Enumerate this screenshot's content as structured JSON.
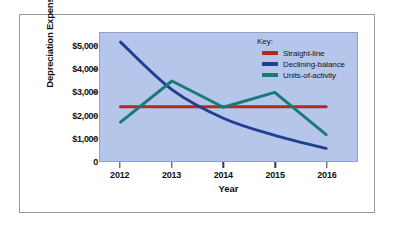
{
  "figure": {
    "background_color": "#ffffff",
    "frame_border_color": "#9a9a9a",
    "plot_background_color": "#b6c6ea"
  },
  "axes": {
    "y_axis_title": "Depreciation Expense",
    "x_axis_title": "Year",
    "y_tick_labels": [
      "$5,000",
      "$4,000",
      "$3,000",
      "$2,000",
      "$1,000",
      "0"
    ],
    "x_tick_labels": [
      "2012",
      "2013",
      "2014",
      "2015",
      "2016"
    ]
  },
  "legend": {
    "title": "Key:",
    "entries": [
      {
        "label": "Straight-line",
        "color": "#b02a2a"
      },
      {
        "label": "Declining-balance",
        "color": "#1f3f8f"
      },
      {
        "label": "Units-of-activity",
        "color": "#1a7a78"
      }
    ]
  },
  "chart_data": {
    "type": "line",
    "title": "",
    "subtitle": "",
    "xlabel": "Year",
    "ylabel": "Depreciation Expense",
    "categories": [
      "2012",
      "2013",
      "2014",
      "2015",
      "2016"
    ],
    "x": [
      2012,
      2013,
      2014,
      2015,
      2016
    ],
    "xlim": [
      2011.6,
      2016.6
    ],
    "ylim": [
      0,
      5600
    ],
    "ytick_values": [
      5000,
      4000,
      3000,
      2000,
      1000,
      0
    ],
    "grid": false,
    "legend_position": "top-right-inside",
    "series": [
      {
        "name": "Straight-line",
        "color": "#b02a2a",
        "smooth": false,
        "values": [
          2375,
          2375,
          2375,
          2375,
          2375
        ]
      },
      {
        "name": "Declining-balance",
        "color": "#1f3f8f",
        "smooth": true,
        "values": [
          5200,
          3120,
          1870,
          1120,
          550
        ]
      },
      {
        "name": "Units-of-activity",
        "color": "#1a7a78",
        "smooth": false,
        "values": [
          1700,
          3500,
          2350,
          3000,
          1150
        ]
      }
    ]
  }
}
